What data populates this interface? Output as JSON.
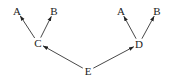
{
  "diagram": {
    "type": "directed-tree",
    "nodes": [
      {
        "id": "A1",
        "label": "A",
        "x": 17,
        "y": 11
      },
      {
        "id": "B1",
        "label": "B",
        "x": 54,
        "y": 11
      },
      {
        "id": "C",
        "label": "C",
        "x": 38,
        "y": 43
      },
      {
        "id": "A2",
        "label": "A",
        "x": 121,
        "y": 11
      },
      {
        "id": "B2",
        "label": "B",
        "x": 157,
        "y": 11
      },
      {
        "id": "D",
        "label": "D",
        "x": 139,
        "y": 44
      },
      {
        "id": "E",
        "label": "E",
        "x": 88,
        "y": 71
      }
    ],
    "edges": [
      {
        "from": "C",
        "to": "A1"
      },
      {
        "from": "C",
        "to": "B1"
      },
      {
        "from": "D",
        "to": "A2"
      },
      {
        "from": "D",
        "to": "B2"
      },
      {
        "from": "E",
        "to": "C"
      },
      {
        "from": "E",
        "to": "D"
      }
    ],
    "colors": {
      "line": "#333333",
      "text": "#222222",
      "background": "#ffffff"
    }
  }
}
